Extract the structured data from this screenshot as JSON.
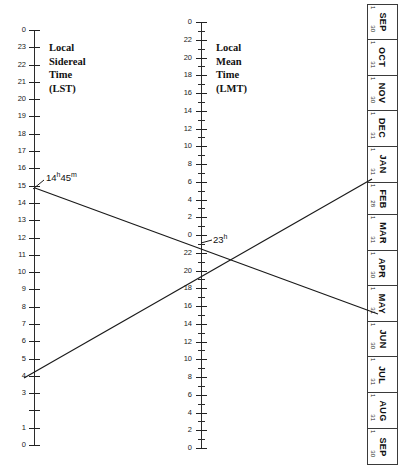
{
  "figure": {
    "type": "nomogram"
  },
  "lst_scale": {
    "caption": "Local\nSidereal\nTime\n(LST)",
    "top_label": "0",
    "labels": [
      "0",
      "23",
      "22",
      "21",
      "20",
      "19",
      "18",
      "17",
      "16",
      "15",
      "14",
      "13",
      "12",
      "11",
      "10",
      "9",
      "8",
      "7",
      "6",
      "5",
      "4",
      "3",
      "",
      "1",
      "0"
    ],
    "axis_top_px": 30,
    "axis_bottom_px": 445,
    "tick_count": 25,
    "label_missing_index": 22
  },
  "lmt_scale": {
    "caption": "Local\nMean\nTime\n(LMT)",
    "labels": [
      "0",
      "22",
      "20",
      "18",
      "16",
      "14",
      "12",
      "10",
      "8",
      "6",
      "4",
      "2",
      "0",
      "22",
      "20",
      "18",
      "16",
      "14",
      "12",
      "10",
      "8",
      "6",
      "4",
      "2",
      "0"
    ],
    "axis_top_px": 22,
    "axis_bottom_px": 448,
    "minor_tick_count": 49
  },
  "calendar": {
    "months": [
      {
        "name": "SEP",
        "start": "1",
        "end": "30",
        "days": 30
      },
      {
        "name": "OCT",
        "start": "1",
        "end": "31",
        "days": 31
      },
      {
        "name": "NOV",
        "start": "1",
        "end": "30",
        "days": 30
      },
      {
        "name": "DEC",
        "start": "1",
        "end": "31",
        "days": 31
      },
      {
        "name": "JAN",
        "start": "1",
        "end": "31",
        "days": 31
      },
      {
        "name": "FEB",
        "start": "1",
        "end": "28",
        "days": 28
      },
      {
        "name": "MAR",
        "start": "1",
        "end": "31",
        "days": 31
      },
      {
        "name": "APR",
        "start": "1",
        "end": "30",
        "days": 30
      },
      {
        "name": "MAY",
        "start": "1",
        "end": "31",
        "days": 31
      },
      {
        "name": "JUN",
        "start": "1",
        "end": "30",
        "days": 30
      },
      {
        "name": "JUL",
        "start": "1",
        "end": "31",
        "days": 31
      },
      {
        "name": "AUG",
        "start": "1",
        "end": "31",
        "days": 31
      },
      {
        "name": "SEP",
        "start": "1",
        "end": "30",
        "days": 30
      }
    ]
  },
  "annotations": [
    {
      "id": "lst-reading",
      "text_main": "14",
      "sup1": "h",
      "text_mid": "45",
      "sup2": "m",
      "x": 46,
      "y": 172
    },
    {
      "id": "lmt-reading",
      "text_main": "23",
      "sup1": "h",
      "text_mid": "",
      "sup2": "",
      "x": 213,
      "y": 234
    }
  ],
  "transfer_lines": [
    {
      "id": "line-descending",
      "x1": 35,
      "y1": 188,
      "x2": 378,
      "y2": 314,
      "note": "LST 14h45m to late May"
    },
    {
      "id": "line-ascending",
      "x1": 24,
      "y1": 378,
      "x2": 372,
      "y2": 179,
      "note": "rises to JAN 31 / FEB 1"
    }
  ],
  "chart_data": {
    "type": "line",
    "title": "",
    "xlabel": "",
    "ylabel": "",
    "series": [
      {
        "name": "line-descending",
        "x": [
          35,
          378
        ],
        "y": [
          188,
          314
        ]
      },
      {
        "name": "line-ascending",
        "x": [
          24,
          372
        ],
        "y": [
          378,
          179
        ]
      }
    ],
    "axes": [
      {
        "name": "Local Sidereal Time (LST)",
        "orientation": "vertical",
        "direction": "descending",
        "ticks": [
          "0",
          "23",
          "22",
          "21",
          "20",
          "19",
          "18",
          "17",
          "16",
          "15",
          "14",
          "13",
          "12",
          "11",
          "10",
          "9",
          "8",
          "7",
          "6",
          "5",
          "4",
          "3",
          "2",
          "1",
          "0"
        ],
        "units": "hours"
      },
      {
        "name": "Local Mean Time (LMT)",
        "orientation": "vertical",
        "direction": "descending-wrapping",
        "ticks": [
          "0",
          "22",
          "20",
          "18",
          "16",
          "14",
          "12",
          "10",
          "8",
          "6",
          "4",
          "2",
          "0",
          "22",
          "20",
          "18",
          "16",
          "14",
          "12",
          "10",
          "8",
          "6",
          "4",
          "2",
          "0"
        ],
        "units": "hours"
      },
      {
        "name": "Calendar",
        "orientation": "vertical",
        "ticks": [
          "SEP",
          "OCT",
          "NOV",
          "DEC",
          "JAN",
          "FEB",
          "MAR",
          "APR",
          "MAY",
          "JUN",
          "JUL",
          "AUG",
          "SEP"
        ],
        "units": "months"
      }
    ],
    "annotations": [
      "14h45m",
      "23h"
    ],
    "grid": false,
    "legend": "none"
  }
}
